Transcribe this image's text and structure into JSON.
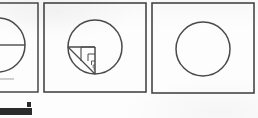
{
  "page": {
    "kind": "scanned-figure-strip",
    "width": 258,
    "height": 118,
    "background_color": "#fdfdfd",
    "ink_color": "#3a3a3a",
    "caption": ""
  },
  "panels": [
    {
      "id": "panel-left",
      "label": "",
      "clipped": true,
      "frame": {
        "x": -40,
        "y": 3,
        "width": 78,
        "height": 89
      },
      "figure": {
        "type": "circle-with-radius",
        "circle": {
          "cx": -2,
          "cy": 45,
          "r": 27
        },
        "lines": [
          {
            "name": "horizontal-radius",
            "x1": -2,
            "y1": 45,
            "x2": 25,
            "y2": 45
          }
        ]
      }
    },
    {
      "id": "panel-middle",
      "label": "",
      "clipped": false,
      "frame": {
        "x": 44,
        "y": 3,
        "width": 102,
        "height": 89
      },
      "figure": {
        "type": "circle-with-inscribed-nested-squares",
        "circle": {
          "cx": 95,
          "cy": 47,
          "r": 27
        },
        "lines": [
          {
            "name": "horizontal-radius",
            "x1": 68,
            "y1": 47,
            "x2": 95,
            "y2": 47
          },
          {
            "name": "vertical-radius",
            "x1": 95,
            "y1": 47,
            "x2": 95,
            "y2": 74
          },
          {
            "name": "diagonal-chord",
            "x1": 68,
            "y1": 47,
            "x2": 95,
            "y2": 74
          }
        ],
        "nested_steps": [
          {
            "name": "step-1",
            "x": 81,
            "y": 47,
            "size": 14
          },
          {
            "name": "step-2",
            "x": 88,
            "y": 54,
            "size": 7
          },
          {
            "name": "step-3",
            "x": 91.5,
            "y": 61,
            "size": 3.5
          },
          {
            "name": "step-4",
            "x": 93.2,
            "y": 67.5,
            "size": 1.8
          }
        ]
      }
    },
    {
      "id": "panel-right",
      "label": "",
      "clipped": false,
      "frame": {
        "x": 152,
        "y": 3,
        "width": 102,
        "height": 90
      },
      "figure": {
        "type": "plain-circle",
        "circle": {
          "cx": 203,
          "cy": 49,
          "r": 27
        },
        "lines": [],
        "nested_steps": []
      }
    }
  ],
  "artifacts": [
    {
      "id": "scan-bar",
      "name": "scan-edge-bar",
      "shape": "rect",
      "x": 0,
      "y": 108,
      "width": 32,
      "height": 7,
      "color": "#2b2b2b"
    },
    {
      "id": "scan-dot",
      "name": "scan-speck",
      "shape": "rect",
      "x": 27,
      "y": 102,
      "width": 4,
      "height": 5,
      "color": "#2b2b2b"
    },
    {
      "id": "scan-smudge-left",
      "name": "scan-smudge",
      "shape": "rect",
      "x": 0,
      "y": 78,
      "width": 14,
      "height": 2,
      "color": "#cfcfcf"
    }
  ]
}
